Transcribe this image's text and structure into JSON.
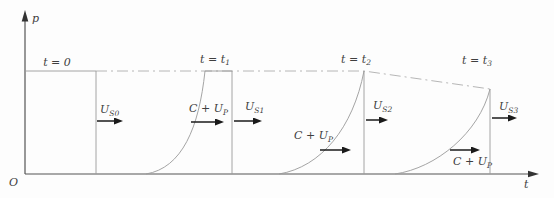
{
  "axes": {
    "y_label": "p",
    "x_label": "t",
    "origin": "O"
  },
  "pulses": [
    {
      "time": {
        "main": "t = 0",
        "sub": ""
      },
      "shock": {
        "main": "U",
        "sub": "S0"
      }
    },
    {
      "time": {
        "main": "t = t",
        "sub": "1"
      },
      "shock": {
        "main": "U",
        "sub": "S1"
      },
      "release": {
        "main": "C + U",
        "sub": "P"
      }
    },
    {
      "time": {
        "main": "t = t",
        "sub": "2"
      },
      "shock": {
        "main": "U",
        "sub": "S2"
      },
      "release": {
        "main": "C + U",
        "sub": "P"
      }
    },
    {
      "time": {
        "main": "t = t",
        "sub": "3"
      },
      "shock": {
        "main": "U",
        "sub": "S3"
      },
      "release": {
        "main": "C + U",
        "sub": "P"
      }
    }
  ],
  "colors": {
    "curve": "#9a9a9a",
    "envelope": "#aeaeae",
    "axis": "#555555",
    "arrow": "#1a1a1a",
    "text": "#3f3f3f",
    "background": "#fdfdfd"
  }
}
